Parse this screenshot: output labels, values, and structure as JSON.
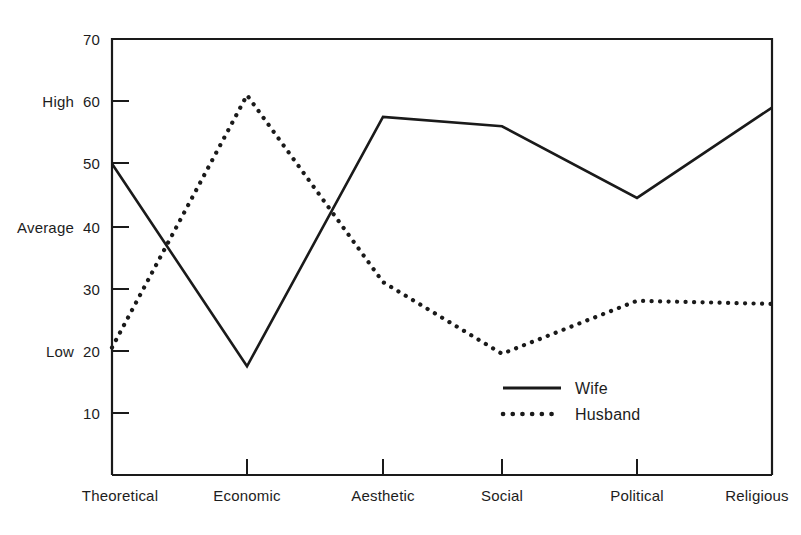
{
  "chart_data": {
    "type": "line",
    "title": "",
    "subtitle": "",
    "xlabel": "",
    "ylabel": "",
    "categories": [
      "Theoretical",
      "Economic",
      "Aesthetic",
      "Social",
      "Political",
      "Religious"
    ],
    "series": [
      {
        "name": "Wife",
        "style": "solid",
        "values": [
          50,
          17.5,
          57.5,
          56,
          44.5,
          59
        ]
      },
      {
        "name": "Husband",
        "style": "dotted",
        "values": [
          20.5,
          61,
          31,
          19.5,
          28,
          27.5
        ]
      }
    ],
    "ylim": [
      6,
      70
    ],
    "yticks": [
      70,
      60,
      50,
      40,
      30,
      20,
      10
    ],
    "ytick_labels": [
      "70",
      "60",
      "50",
      "40",
      "30",
      "20",
      "10"
    ],
    "y_qualitative_labels": [
      {
        "value": 60,
        "label": "High"
      },
      {
        "value": 40,
        "label": "Average"
      },
      {
        "value": 20,
        "label": "Low"
      }
    ],
    "grid": false,
    "legend_position": "inside-bottom-center",
    "line_color": "#1a1a1a"
  },
  "legend": {
    "entries": [
      {
        "label": "Wife",
        "style": "solid"
      },
      {
        "label": "Husband",
        "style": "dotted"
      }
    ]
  },
  "axis": {
    "y_ticks": [
      "70",
      "60",
      "50",
      "40",
      "30",
      "20",
      "10"
    ],
    "qualitative": [
      "High",
      "Average",
      "Low"
    ],
    "x_categories": [
      "Theoretical",
      "Economic",
      "Aesthetic",
      "Social",
      "Political",
      "Religious"
    ]
  }
}
